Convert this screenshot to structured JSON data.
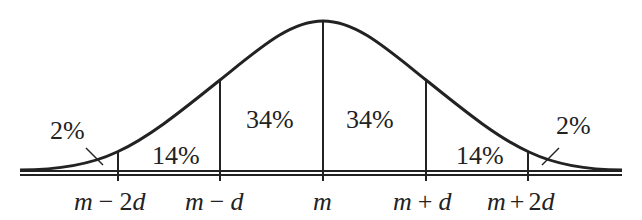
{
  "diagram": {
    "regions": [
      {
        "id": "left-tail",
        "label": "2%"
      },
      {
        "id": "m-2d-to-m-d",
        "label": "14%"
      },
      {
        "id": "m-d-to-m",
        "label": "34%"
      },
      {
        "id": "m-to-m+d",
        "label": "34%"
      },
      {
        "id": "m+d-to-m+2d",
        "label": "14%"
      },
      {
        "id": "right-tail",
        "label": "2%"
      }
    ],
    "ticks": [
      {
        "var": "m",
        "op": "−",
        "coef": "2",
        "d": "d"
      },
      {
        "var": "m",
        "op": "−",
        "coef": "",
        "d": "d"
      },
      {
        "var": "m",
        "op": "",
        "coef": "",
        "d": ""
      },
      {
        "var": "m",
        "op": "+",
        "coef": "",
        "d": "d"
      },
      {
        "var": "m",
        "op": "+",
        "coef": "2",
        "d": "d"
      }
    ],
    "colors": {
      "stroke": "#222222",
      "background": "#ffffff"
    }
  }
}
